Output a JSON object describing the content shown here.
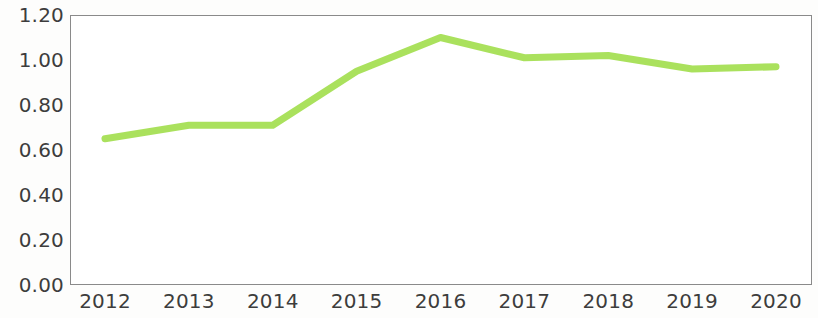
{
  "chart_data": {
    "type": "line",
    "title": "",
    "subtitle": "",
    "xlabel": "",
    "ylabel": "",
    "categories": [
      "2012",
      "2013",
      "2014",
      "2015",
      "2016",
      "2017",
      "2018",
      "2019",
      "2020"
    ],
    "series": [
      {
        "name": "series-1",
        "color": "#A3DE4F",
        "values": [
          0.65,
          0.71,
          0.71,
          0.95,
          1.1,
          1.01,
          1.02,
          0.96,
          0.97
        ]
      }
    ],
    "ylim": [
      0.0,
      1.2
    ],
    "y_ticks": [
      "0.00",
      "0.20",
      "0.40",
      "0.60",
      "0.80",
      "1.00",
      "1.20"
    ],
    "y_tick_values": [
      0.0,
      0.2,
      0.4,
      0.6,
      0.8,
      1.0,
      1.2
    ],
    "x_ticks": [
      "2012",
      "2013",
      "2014",
      "2015",
      "2016",
      "2017",
      "2018",
      "2019",
      "2020"
    ],
    "grid": false,
    "markers": false,
    "legend": null,
    "legend_position": "none",
    "annotations": [],
    "axis_color": "#8a8a8a",
    "tick_label_color": "#3d3d3d",
    "plot_background": "#ffffff",
    "figure_background": "#fdfdfc"
  }
}
